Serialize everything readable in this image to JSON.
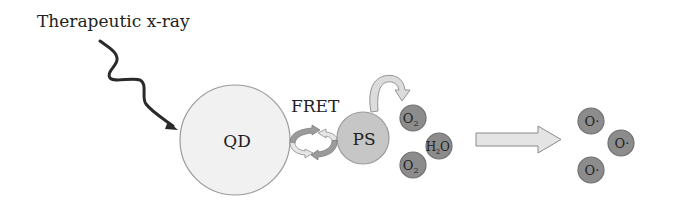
{
  "diagram": {
    "title_label": "Therapeutic x-ray",
    "quantum_dot": {
      "label": "QD",
      "fill": "#f1f1f1",
      "stroke": "#9a9a9a"
    },
    "fret": {
      "label": "FRET"
    },
    "photosensitizer": {
      "label": "PS",
      "fill": "#c6c6c6",
      "stroke": "#9a9a9a"
    },
    "reactants": [
      {
        "label": "O",
        "sub": "2"
      },
      {
        "label": "H",
        "sub": "2",
        "tail": "O"
      },
      {
        "label": "O",
        "sub": "2"
      }
    ],
    "products": [
      {
        "label": "O·"
      },
      {
        "label": "O·"
      },
      {
        "label": "O·"
      }
    ],
    "colors": {
      "molecule_fill": "#8c8c8c",
      "molecule_stroke": "#707070",
      "arrow_light": "#e4e4e4",
      "arrow_dark": "#9b9b9b",
      "arrow_stroke": "#8a8a8a",
      "xray": "#2a2a2a"
    }
  }
}
